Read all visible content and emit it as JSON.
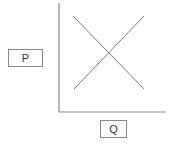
{
  "diagram": {
    "type": "supply-demand",
    "y_axis_label": "P",
    "x_axis_label": "Q",
    "colors": {
      "axis": "#8a8a8a",
      "curve": "#7a7a7a",
      "box_border": "#8a8a8a"
    },
    "axes": {
      "origin": [
        59,
        112
      ],
      "y_top": [
        59,
        3
      ],
      "x_right": [
        166,
        112
      ]
    },
    "curves": [
      {
        "name": "demand",
        "from": [
          73,
          16
        ],
        "to": [
          144,
          89
        ]
      },
      {
        "name": "supply",
        "from": [
          74,
          89
        ],
        "to": [
          144,
          16
        ]
      }
    ]
  }
}
